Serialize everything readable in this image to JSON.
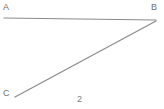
{
  "figure": {
    "number_label": "2",
    "background_color": "#ffffff",
    "stroke_color": "#8a8a8a",
    "label_color": "#6f6f6f",
    "width": 164,
    "height": 109,
    "vertices": [
      {
        "id": "A",
        "label": "A",
        "x": 4,
        "y": 18
      },
      {
        "id": "B",
        "label": "B",
        "x": 156,
        "y": 20
      },
      {
        "id": "C",
        "label": "C",
        "x": 15,
        "y": 97
      }
    ],
    "segments": [
      {
        "id": "AB",
        "from": "A",
        "to": "B",
        "x1": 4,
        "y1": 18,
        "x2": 156,
        "y2": 20,
        "stroke": "#8a8a8a",
        "width": 1.2
      },
      {
        "id": "BC",
        "from": "B",
        "to": "C",
        "x1": 156,
        "y1": 21,
        "x2": 15,
        "y2": 97,
        "stroke": "#8a8a8a",
        "width": 1.2
      }
    ]
  }
}
